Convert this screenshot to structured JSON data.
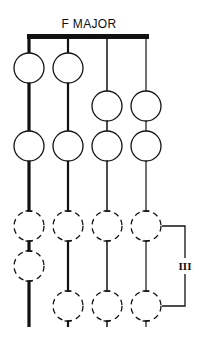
{
  "title": "F MAJOR",
  "bracket_label": "III",
  "colors": {
    "ink": "#111111",
    "background": "#ffffff"
  },
  "layout": {
    "nut": {
      "x1": 27,
      "x2": 149,
      "y": 34,
      "thickness": 5
    },
    "strings": [
      {
        "x": 29,
        "width": 3.2,
        "bottom": 327
      },
      {
        "x": 68,
        "width": 2.2,
        "bottom": 327
      },
      {
        "x": 107,
        "width": 1.5,
        "bottom": 327
      },
      {
        "x": 146,
        "width": 1.2,
        "bottom": 327
      }
    ],
    "radius": 15
  },
  "notes": [
    {
      "string": 0,
      "y": 68,
      "style": "solid",
      "label": "F"
    },
    {
      "string": 1,
      "y": 68,
      "style": "solid",
      "label": "C"
    },
    {
      "string": 2,
      "y": 106,
      "style": "solid",
      "label": "F"
    },
    {
      "string": 3,
      "y": 106,
      "style": "solid",
      "label": "A"
    },
    {
      "string": 0,
      "y": 146,
      "style": "solid",
      "label": "G"
    },
    {
      "string": 1,
      "y": 146,
      "style": "solid",
      "label": "D"
    },
    {
      "string": 2,
      "y": 146,
      "style": "solid",
      "label": "G"
    },
    {
      "string": 3,
      "y": 146,
      "style": "solid",
      "label": "B♭"
    },
    {
      "string": 0,
      "y": 226,
      "style": "dashed",
      "label": "A"
    },
    {
      "string": 1,
      "y": 226,
      "style": "dashed",
      "label": "E"
    },
    {
      "string": 2,
      "y": 226,
      "style": "dashed",
      "label": "A"
    },
    {
      "string": 3,
      "y": 226,
      "style": "dashed",
      "label": "C"
    },
    {
      "string": 0,
      "y": 266,
      "style": "dashed",
      "label": "B♭"
    },
    {
      "string": 1,
      "y": 306,
      "style": "dashed",
      "label": "F"
    },
    {
      "string": 2,
      "y": 306,
      "style": "dashed",
      "label": "B♭"
    },
    {
      "string": 3,
      "y": 306,
      "style": "dashed",
      "label": "D"
    }
  ],
  "bracket": {
    "x_start": 162,
    "x_end": 185,
    "y_top": 226,
    "y_bottom": 306,
    "label_y": 270
  }
}
